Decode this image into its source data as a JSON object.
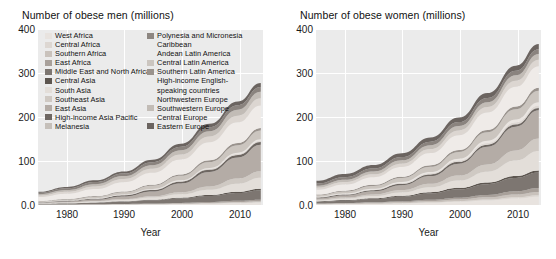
{
  "figure": {
    "background": "#ffffff",
    "plot_background": "#ebebeb",
    "grid_color": "#ffffff"
  },
  "panels": [
    {
      "key": "men",
      "title": "Number of obese men (millions)",
      "xlabel": "Year",
      "yticks": [
        "400",
        "300",
        "200",
        "100",
        "0.0"
      ],
      "xticks": [
        "1980",
        "1990",
        "2000",
        "2010"
      ]
    },
    {
      "key": "women",
      "title": "Number of obese women (millions)",
      "xlabel": "Year",
      "yticks": [
        "400",
        "300",
        "200",
        "100",
        "0.0"
      ],
      "xticks": [
        "1980",
        "1990",
        "2000",
        "2010"
      ]
    }
  ],
  "legend": {
    "column_a": [
      {
        "label": "West Africa",
        "color": "#e8e3df"
      },
      {
        "label": "Central Africa",
        "color": "#ddd7d2"
      },
      {
        "label": "Southern Africa",
        "color": "#c9c2bc"
      },
      {
        "label": "East Africa",
        "color": "#a8a09a"
      },
      {
        "label": "Middle East and North Africa",
        "color": "#7d7671"
      },
      {
        "label": "Central Asia",
        "color": "#5d5650"
      },
      {
        "label": "South Asia",
        "color": "#e3ded9"
      },
      {
        "label": "Southeast Asia",
        "color": "#cfc9c3"
      },
      {
        "label": "East Asia",
        "color": "#b4aca6"
      },
      {
        "label": "High-income Asia Pacific",
        "color": "#6e6762"
      },
      {
        "label": "Melanesia",
        "color": "#c5bfb9"
      }
    ],
    "column_b": [
      {
        "label": "Polynesia and Micronesia",
        "color": "#8d8681"
      },
      {
        "label": "Caribbean",
        "color": "",
        "no_swatch": true
      },
      {
        "label": "Andean Latin America",
        "color": "",
        "no_swatch": true
      },
      {
        "label": "Central Latin America",
        "color": "#cbc5bf"
      },
      {
        "label": "Southern Latin America",
        "color": "#9a938d"
      },
      {
        "label": "High-income English-",
        "color": "",
        "no_swatch": true
      },
      {
        "label": "speaking countries",
        "color": "",
        "no_swatch": true
      },
      {
        "label": "Northwestern Europe",
        "color": "",
        "no_swatch": true
      },
      {
        "label": "Southwestern Europe",
        "color": "#c2bcb6"
      },
      {
        "label": "Central Europe",
        "color": "#8a8season",
        "no_swatch": false
      },
      {
        "label": "Eastern Europe",
        "color": "#6b6460"
      }
    ]
  },
  "chart_data": {
    "type": "area",
    "stacked": true,
    "xlabel": "Year",
    "ylabel": "millions",
    "xlim": [
      1975,
      2014
    ],
    "ylim": [
      0,
      400
    ],
    "grid": true,
    "legend_position": "inside-top-left",
    "x": [
      1975,
      1980,
      1985,
      1990,
      1995,
      2000,
      2005,
      2010,
      2014
    ],
    "panels": [
      {
        "name": "Number of obese men (millions)",
        "total": [
          30,
          42,
          58,
          78,
          103,
          135,
          175,
          220,
          266
        ],
        "series": [
          {
            "name": "West Africa",
            "color": "#e8e3df",
            "values": [
              0.3,
              0.4,
              0.6,
              0.9,
              1.3,
              1.9,
              2.8,
              4.0,
              5.2
            ]
          },
          {
            "name": "Central Africa",
            "color": "#ddd7d2",
            "values": [
              0.1,
              0.15,
              0.2,
              0.3,
              0.4,
              0.6,
              0.8,
              1.1,
              1.4
            ]
          },
          {
            "name": "Southern Africa",
            "color": "#c9c2bc",
            "values": [
              0.2,
              0.25,
              0.35,
              0.5,
              0.7,
              0.9,
              1.2,
              1.6,
              2.0
            ]
          },
          {
            "name": "East Africa",
            "color": "#a8a09a",
            "values": [
              0.3,
              0.4,
              0.5,
              0.7,
              1.0,
              1.4,
              2.0,
              2.8,
              3.6
            ]
          },
          {
            "name": "Middle East and North Africa",
            "color": "#7d7671",
            "values": [
              1.4,
              2.2,
              3.4,
              5.0,
              7.2,
              10.0,
              13.5,
              17.5,
              21.0
            ]
          },
          {
            "name": "Central Asia",
            "color": "#5d5650",
            "values": [
              0.5,
              0.7,
              0.9,
              1.2,
              1.5,
              1.9,
              2.4,
              3.0,
              3.5
            ]
          },
          {
            "name": "South Asia",
            "color": "#e3ded9",
            "values": [
              0.8,
              1.2,
              1.9,
              3.0,
              4.8,
              7.6,
              12.0,
              18.5,
              25.0
            ]
          },
          {
            "name": "Southeast Asia",
            "color": "#cfc9c3",
            "values": [
              0.5,
              0.8,
              1.2,
              1.9,
              3.0,
              4.8,
              7.5,
              11.5,
              15.0
            ]
          },
          {
            "name": "East Asia",
            "color": "#b4aca6",
            "values": [
              1.0,
              1.8,
              3.2,
              6.0,
              11.0,
              20.0,
              33.0,
              48.0,
              60.0
            ]
          },
          {
            "name": "High-income Asia Pacific",
            "color": "#6e6762",
            "values": [
              1.0,
              1.4,
              1.9,
              2.5,
              3.2,
              4.0,
              4.8,
              5.6,
              6.2
            ]
          },
          {
            "name": "Melanesia",
            "color": "#c5bfb9",
            "values": [
              0.05,
              0.07,
              0.09,
              0.12,
              0.16,
              0.21,
              0.27,
              0.34,
              0.4
            ]
          },
          {
            "name": "Polynesia and Micronesia",
            "color": "#8d8681",
            "values": [
              0.05,
              0.07,
              0.1,
              0.13,
              0.17,
              0.22,
              0.28,
              0.34,
              0.4
            ]
          },
          {
            "name": "Caribbean",
            "color": "#ded8d3",
            "values": [
              0.3,
              0.4,
              0.5,
              0.7,
              0.9,
              1.2,
              1.6,
              2.0,
              2.4
            ]
          },
          {
            "name": "Andean Latin America",
            "color": "#eae5e1",
            "values": [
              0.3,
              0.4,
              0.6,
              0.8,
              1.1,
              1.5,
              2.0,
              2.6,
              3.1
            ]
          },
          {
            "name": "Central Latin America",
            "color": "#cbc5bf",
            "values": [
              1.5,
              2.3,
              3.4,
              5.0,
              7.2,
              10.0,
              13.5,
              17.0,
              20.0
            ]
          },
          {
            "name": "Southern Latin America",
            "color": "#9a938d",
            "values": [
              0.8,
              1.1,
              1.5,
              2.0,
              2.6,
              3.3,
              4.1,
              5.0,
              5.7
            ]
          },
          {
            "name": "High-income English-speaking countries",
            "color": "#efebe8",
            "values": [
              9.0,
              12.0,
              16.0,
              21.0,
              27.0,
              34.0,
              41.0,
              47.0,
              51.0
            ]
          },
          {
            "name": "Northwestern Europe",
            "color": "#dcd6d1",
            "values": [
              3.5,
              4.5,
              5.8,
              7.3,
              9.0,
              11.0,
              13.0,
              15.0,
              16.5
            ]
          },
          {
            "name": "Southwestern Europe",
            "color": "#c2bcb6",
            "values": [
              3.0,
              4.0,
              5.2,
              6.6,
              8.2,
              10.0,
              12.0,
              13.8,
              15.0
            ]
          },
          {
            "name": "Central Europe",
            "color": "#8a837e",
            "values": [
              3.0,
              3.8,
              4.7,
              5.7,
              6.8,
              8.0,
              9.2,
              10.3,
              11.0
            ]
          },
          {
            "name": "Eastern Europe",
            "color": "#6b6460",
            "values": [
              2.5,
              3.2,
              4.0,
              4.9,
              5.8,
              6.8,
              7.7,
              8.5,
              9.0
            ]
          }
        ]
      },
      {
        "name": "Number of obese women (millions)",
        "total": [
          69,
          86,
          106,
          131,
          162,
          199,
          242,
          289,
          330
        ],
        "series": [
          {
            "name": "West Africa",
            "color": "#e8e3df",
            "values": [
              1.2,
              1.7,
              2.4,
              3.4,
              5.0,
              7.2,
              10.3,
              14.5,
              18.5
            ]
          },
          {
            "name": "Central Africa",
            "color": "#ddd7d2",
            "values": [
              0.3,
              0.4,
              0.6,
              0.8,
              1.1,
              1.5,
              2.1,
              2.9,
              3.6
            ]
          },
          {
            "name": "Southern Africa",
            "color": "#c9c2bc",
            "values": [
              1.2,
              1.5,
              1.9,
              2.5,
              3.2,
              4.0,
              5.0,
              6.2,
              7.2
            ]
          },
          {
            "name": "East Africa",
            "color": "#a8a09a",
            "values": [
              0.8,
              1.1,
              1.5,
              2.1,
              2.9,
              4.0,
              5.5,
              7.5,
              9.3
            ]
          },
          {
            "name": "Middle East and North Africa",
            "color": "#7d7671",
            "values": [
              3.5,
              5.0,
              7.2,
              10.2,
              14.2,
              19.0,
              24.5,
              30.5,
              35.0
            ]
          },
          {
            "name": "Central Asia",
            "color": "#5d5650",
            "values": [
              1.2,
              1.5,
              1.9,
              2.3,
              2.8,
              3.3,
              3.9,
              4.5,
              5.0
            ]
          },
          {
            "name": "South Asia",
            "color": "#e3ded9",
            "values": [
              2.2,
              3.2,
              4.8,
              7.2,
              11.0,
              16.5,
              24.5,
              35.0,
              44.0
            ]
          },
          {
            "name": "Southeast Asia",
            "color": "#cfc9c3",
            "values": [
              1.8,
              2.6,
              3.8,
              5.5,
              8.0,
              11.5,
              16.5,
              23.0,
              28.5
            ]
          },
          {
            "name": "East Asia",
            "color": "#b4aca6",
            "values": [
              3.0,
              4.5,
              7.0,
              11.0,
              17.5,
              27.0,
              40.0,
              54.0,
              64.0
            ]
          },
          {
            "name": "High-income Asia Pacific",
            "color": "#6e6762",
            "values": [
              1.8,
              2.2,
              2.7,
              3.2,
              3.7,
              4.2,
              4.7,
              5.1,
              5.4
            ]
          },
          {
            "name": "Melanesia",
            "color": "#c5bfb9",
            "values": [
              0.07,
              0.09,
              0.12,
              0.16,
              0.21,
              0.27,
              0.35,
              0.43,
              0.5
            ]
          },
          {
            "name": "Polynesia and Micronesia",
            "color": "#8d8681",
            "values": [
              0.08,
              0.1,
              0.13,
              0.17,
              0.22,
              0.28,
              0.35,
              0.43,
              0.5
            ]
          },
          {
            "name": "Caribbean",
            "color": "#ded8d3",
            "values": [
              0.7,
              0.9,
              1.2,
              1.6,
              2.1,
              2.7,
              3.4,
              4.2,
              4.8
            ]
          },
          {
            "name": "Andean Latin America",
            "color": "#eae5e1",
            "values": [
              0.8,
              1.1,
              1.5,
              2.1,
              2.8,
              3.7,
              4.8,
              6.0,
              7.0
            ]
          },
          {
            "name": "Central Latin America",
            "color": "#cbc5bf",
            "values": [
              3.5,
              4.8,
              6.6,
              9.0,
              12.0,
              15.5,
              19.5,
              23.5,
              26.5
            ]
          },
          {
            "name": "Southern Latin America",
            "color": "#9a938d",
            "values": [
              1.5,
              1.9,
              2.4,
              3.0,
              3.7,
              4.5,
              5.3,
              6.1,
              6.7
            ]
          },
          {
            "name": "High-income English-speaking countries",
            "color": "#efebe8",
            "values": [
              11.0,
              14.0,
              17.5,
              22.0,
              27.5,
              33.5,
              39.5,
              45.0,
              49.0
            ]
          },
          {
            "name": "Northwestern Europe",
            "color": "#dcd6d1",
            "values": [
              4.5,
              5.4,
              6.5,
              7.8,
              9.2,
              10.8,
              12.3,
              13.7,
              14.8
            ]
          },
          {
            "name": "Southwestern Europe",
            "color": "#c2bcb6",
            "values": [
              4.5,
              5.4,
              6.4,
              7.5,
              8.7,
              10.0,
              11.2,
              12.3,
              13.0
            ]
          },
          {
            "name": "Central Europe",
            "color": "#8a837e",
            "values": [
              5.0,
              5.8,
              6.6,
              7.4,
              8.2,
              9.0,
              9.7,
              10.3,
              10.7
            ]
          },
          {
            "name": "Eastern Europe",
            "color": "#6b6460",
            "values": [
              6.5,
              7.3,
              8.1,
              8.9,
              9.6,
              10.3,
              10.9,
              11.4,
              11.7
            ]
          }
        ]
      }
    ]
  }
}
